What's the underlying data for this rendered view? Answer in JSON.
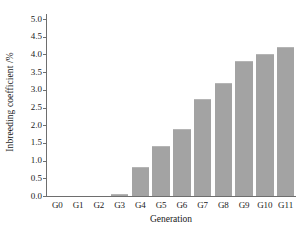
{
  "chart_data": {
    "type": "bar",
    "title": "",
    "xlabel": "Generation",
    "ylabel": "Inbreeding coefficient /%",
    "categories": [
      "G0",
      "G1",
      "G2",
      "G3",
      "G4",
      "G5",
      "G6",
      "G7",
      "G8",
      "G9",
      "G10",
      "G11"
    ],
    "values": [
      0.0,
      0.0,
      0.0,
      0.05,
      0.82,
      1.4,
      1.88,
      2.74,
      3.2,
      3.8,
      4.0,
      4.2
    ],
    "ylim": [
      0.0,
      5.0
    ],
    "ytick_values": [
      0.0,
      0.5,
      1.0,
      1.5,
      2.0,
      2.5,
      3.0,
      3.5,
      4.0,
      4.5,
      5.0
    ],
    "ytick_labels": [
      "0.0",
      "0.5",
      "1.0",
      "1.5",
      "2.0",
      "2.5",
      "3.0",
      "3.5",
      "4.0",
      "4.5",
      "5.0"
    ],
    "grid": false,
    "legend": null,
    "series_color": "#a3a3a3",
    "axis_color": "#6e6e6e",
    "text_color": "#1a1a1a"
  }
}
